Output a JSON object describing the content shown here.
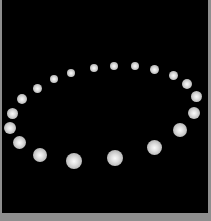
{
  "scene": {
    "description": "Ring of white spheres arranged in a perspective ellipse on black background",
    "background_color": "#000000",
    "frame_color": "#8e8e8e",
    "sphere_color": "#e0e0e0",
    "sphere_count": 20
  },
  "spheres": [
    {
      "cx": 71,
      "cy": 73,
      "r": 4
    },
    {
      "cx": 94,
      "cy": 68,
      "r": 4
    },
    {
      "cx": 114,
      "cy": 66,
      "r": 4
    },
    {
      "cx": 135,
      "cy": 66,
      "r": 4
    },
    {
      "cx": 154,
      "cy": 69,
      "r": 4.5
    },
    {
      "cx": 173,
      "cy": 75,
      "r": 4.5
    },
    {
      "cx": 187,
      "cy": 84,
      "r": 5
    },
    {
      "cx": 196,
      "cy": 96,
      "r": 5.5
    },
    {
      "cx": 194,
      "cy": 113,
      "r": 6
    },
    {
      "cx": 180,
      "cy": 130,
      "r": 7
    },
    {
      "cx": 154,
      "cy": 147,
      "r": 7.5
    },
    {
      "cx": 115,
      "cy": 158,
      "r": 8
    },
    {
      "cx": 74,
      "cy": 161,
      "r": 8
    },
    {
      "cx": 40,
      "cy": 155,
      "r": 7
    },
    {
      "cx": 19,
      "cy": 142,
      "r": 6.5
    },
    {
      "cx": 10,
      "cy": 128,
      "r": 6
    },
    {
      "cx": 12,
      "cy": 113,
      "r": 5.5
    },
    {
      "cx": 22,
      "cy": 99,
      "r": 5
    },
    {
      "cx": 37,
      "cy": 88,
      "r": 4.5
    },
    {
      "cx": 54,
      "cy": 79,
      "r": 4
    }
  ]
}
